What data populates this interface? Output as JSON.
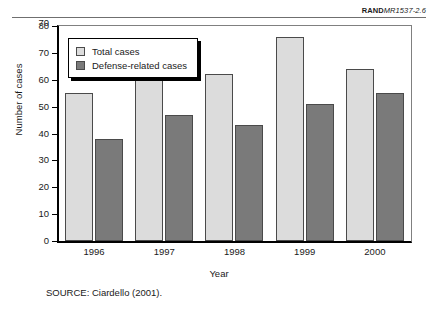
{
  "figure_id": {
    "prefix": "RAND",
    "suffix": "MR1537-2.6"
  },
  "source_note": "SOURCE:  Ciardello (2001).",
  "legend": {
    "position": "top-left-inside",
    "entries": [
      {
        "label": "Total cases",
        "color": "#dcdcdc"
      },
      {
        "label": "Defense-related cases",
        "color": "#7a7a7a"
      }
    ]
  },
  "y_axis": {
    "title": "Number of cases",
    "ticks": [
      "0",
      "10",
      "20",
      "30",
      "40",
      "50",
      "60",
      "70",
      "80"
    ],
    "over_label": "70"
  },
  "x_axis": {
    "title": "Year"
  },
  "chart_data": {
    "type": "bar",
    "title": "",
    "xlabel": "Year",
    "ylabel": "Number of cases",
    "categories": [
      "1996",
      "1997",
      "1998",
      "1999",
      "2000"
    ],
    "series": [
      {
        "name": "Total cases",
        "color": "#dcdcdc",
        "values": [
          55,
          61,
          62,
          76,
          64
        ]
      },
      {
        "name": "Defense-related cases",
        "color": "#7a7a7a",
        "values": [
          38,
          47,
          43,
          51,
          55
        ]
      }
    ],
    "ylim": [
      0,
      80
    ],
    "ytick_step": 10,
    "grid": false,
    "legend_position": "top-left"
  }
}
